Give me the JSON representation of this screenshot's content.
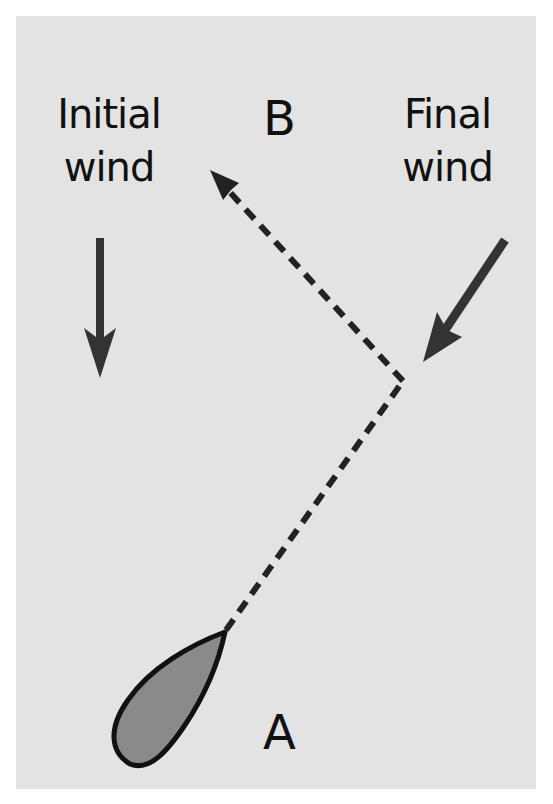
{
  "labels": {
    "initial_wind": [
      "Initial",
      "wind"
    ],
    "final_wind": [
      "Final",
      "wind"
    ],
    "point_b": "B",
    "point_a": "A"
  },
  "colors": {
    "background": "#e3e3e3",
    "arrow": "#333333",
    "boat_fill": "#8a8a8a",
    "boat_outline": "#111111",
    "text": "#111111"
  },
  "elements": {
    "initial_wind_arrow": {
      "direction": "down"
    },
    "final_wind_arrow": {
      "direction": "down-left"
    },
    "course_path": {
      "style": "dashed",
      "from": "A",
      "via": "tack point",
      "to": "B"
    },
    "boat": {
      "heading": "up-right toward tack point"
    }
  }
}
